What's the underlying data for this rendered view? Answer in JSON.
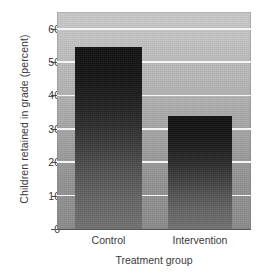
{
  "chart_data": {
    "type": "bar",
    "title": "",
    "categories": [
      "Control",
      "Intervention"
    ],
    "values": [
      54.5,
      34
    ],
    "xlabel": "Treatment group",
    "ylabel": "Children retained in grade (percent)",
    "ylim": [
      0,
      65
    ],
    "yticks": [
      0,
      10,
      20,
      30,
      40,
      50,
      60
    ],
    "ytick_labels": [
      "0",
      "10",
      "20",
      "30",
      "40",
      "50",
      "60"
    ],
    "grid": "horizontal",
    "legend": "none",
    "series": [
      {
        "name": "Children retained in grade (percent)",
        "values": [
          54.5,
          34
        ]
      }
    ]
  },
  "style": {
    "bar_top_color": "#131313",
    "bar_bottom_color": "#747474",
    "plot_top_color": "#c9c9c9",
    "plot_bottom_color": "#8b8b8b",
    "gridline_color": "#f4f4f4",
    "axis_color": "#555555",
    "text_color": "#3a3a3a",
    "page_background": "#ffffff"
  }
}
